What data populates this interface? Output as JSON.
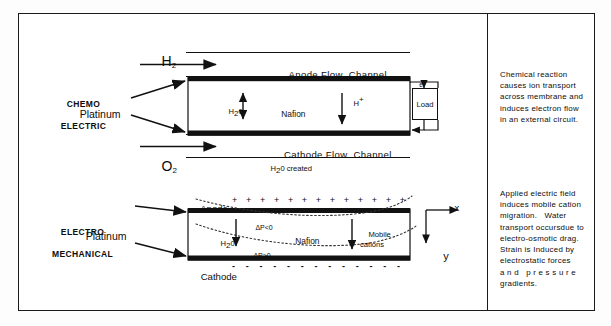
{
  "figure": {
    "border_color": "#1a1a1a",
    "ink_color": "#0d0d0d",
    "membrane_fill": "#ffffff",
    "electrode_color": "#111111"
  },
  "upper": {
    "section_label_line1": "CHEMO",
    "section_label_line2": "ELECTRIC",
    "inlet_top": "H",
    "inlet_top_sub": "2",
    "inlet_bottom": "O",
    "inlet_bottom_sub": "2",
    "catalyst_label": "Platinum",
    "anode_channel": "Anode Flow  Channel",
    "cathode_channel": "Cathode Flow  Channel",
    "membrane_label": "Nafion",
    "water_label": "H",
    "water_sub": "2",
    "water_tail": "0",
    "proton_label": "H",
    "proton_sup": "+",
    "electron_label": "e",
    "electron_sup": "-",
    "load_label": "Load",
    "product_label": "H",
    "product_sub": "2",
    "product_tail": "0 created"
  },
  "lower": {
    "section_label_line1": "ELECTRO",
    "section_label_line2": "MECHANICAL",
    "catalyst_label": "Platinum",
    "anode_label": "Anode",
    "cathode_label": "Cathode",
    "membrane_label": "Nafion",
    "water_label": "H",
    "water_sub": "2",
    "water_tail": "0",
    "pressure_neg": "ΔP<0",
    "pressure_pos": "ΔP>0",
    "mobile_line1": "Mobile",
    "mobile_line2": "cations",
    "axis_x": "x",
    "axis_y": "y",
    "plus_count": 13,
    "plus_symbol": "+",
    "minus_count": 13,
    "minus_symbol": "-"
  },
  "notes": {
    "upper": [
      "Chemical reaction",
      "causes ion transport",
      "across membrane and",
      "induces electron flow",
      "in an external circuit."
    ],
    "lower": [
      "Applied electric field",
      "induces mobile cation",
      "migration.   Water",
      "transport occursdue to",
      "electro-osmotic drag.",
      "Strain is Induced by",
      "electrostatic forces",
      "a n d   p r e s s u r e",
      "gradients."
    ]
  }
}
